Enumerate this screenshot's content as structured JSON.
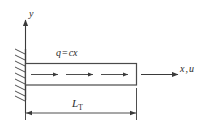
{
  "figure": {
    "labels": {
      "y_axis": "y",
      "x_axis_var": "x",
      "x_axis_sep": ",",
      "x_axis_disp": "u",
      "load_lhs": "q",
      "load_eq": "=",
      "load_rhs": "cx",
      "length_symbol": "L",
      "length_subscript": "T"
    },
    "colors": {
      "line": "#3a3a3a",
      "background": "#ffffff"
    },
    "elements": {
      "wall_name": "fixed-support-wall",
      "hatch_count": "8",
      "load_arrow_count": "3"
    }
  }
}
